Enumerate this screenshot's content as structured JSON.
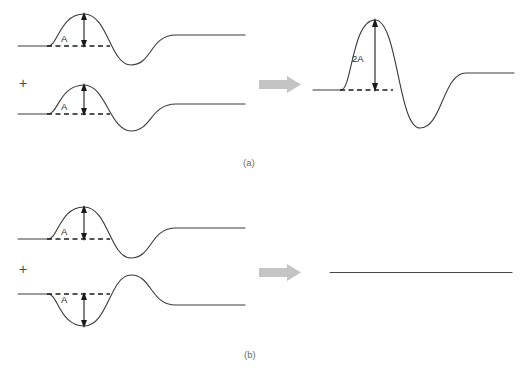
{
  "figure": {
    "background_color": "#ffffff",
    "width": 532,
    "height": 378,
    "stroke_color": "#3a3a3a",
    "dash_color": "#1a1a1a",
    "arrow_color": "#c4c4c4",
    "label_color": "#6b6b6b"
  },
  "panels": [
    {
      "id": "a",
      "label": "(a)",
      "label_pos": {
        "x": 243,
        "y": 166
      },
      "description": "Constructive interference: two identical in-phase pulses add to give a pulse of double amplitude",
      "operator": {
        "symbol": "+",
        "x": 19,
        "y": 88
      },
      "big_arrow": {
        "x": 259,
        "y": 77,
        "width": 42,
        "height": 15
      },
      "inputs": [
        {
          "name": "wave-a-top",
          "baseline_y": 46,
          "amplitude_label": "A",
          "amplitude_label_pos": {
            "x": 61,
            "y": 42
          },
          "amplitude_arrow": {
            "x": 84,
            "y_top": 15,
            "y_bottom": 46
          },
          "dash_line": {
            "x1": 47,
            "x2": 110,
            "y": 46
          },
          "peak": {
            "x": 84,
            "y": 14
          },
          "trough": {
            "x": 131,
            "y": 65
          }
        },
        {
          "name": "wave-a-bottom",
          "baseline_y": 114,
          "amplitude_label": "A",
          "amplitude_label_pos": {
            "x": 61,
            "y": 110
          },
          "amplitude_arrow": {
            "x": 84,
            "y_top": 86,
            "y_bottom": 114
          },
          "dash_line": {
            "x1": 47,
            "x2": 110,
            "y": 114
          },
          "peak": {
            "x": 84,
            "y": 85
          },
          "trough": {
            "x": 131,
            "y": 131
          }
        }
      ],
      "output": {
        "name": "wave-a-result",
        "baseline_y": 90,
        "amplitude_label": "2A",
        "amplitude_label_pos": {
          "x": 352,
          "y": 62
        },
        "amplitude_arrow": {
          "x": 375,
          "y_top": 22,
          "y_bottom": 90
        },
        "dash_line": {
          "x1": 340,
          "x2": 393,
          "y": 90
        },
        "peak": {
          "x": 375,
          "y": 20
        },
        "trough": {
          "x": 420,
          "y": 128
        }
      }
    },
    {
      "id": "b",
      "label": "(b)",
      "label_pos": {
        "x": 244,
        "y": 358
      },
      "description": "Destructive interference: a pulse and its inverted copy cancel to give a flat line",
      "operator": {
        "symbol": "+",
        "x": 19,
        "y": 274
      },
      "big_arrow": {
        "x": 259,
        "y": 265,
        "width": 42,
        "height": 15
      },
      "inputs": [
        {
          "name": "wave-b-top",
          "baseline_y": 239,
          "amplitude_label": "A",
          "amplitude_label_pos": {
            "x": 61,
            "y": 235
          },
          "amplitude_arrow": {
            "x": 84,
            "y_top": 208,
            "y_bottom": 239
          },
          "dash_line": {
            "x1": 47,
            "x2": 110,
            "y": 239
          },
          "peak": {
            "x": 84,
            "y": 207
          },
          "trough": {
            "x": 131,
            "y": 258
          }
        },
        {
          "name": "wave-b-bottom-inverted",
          "baseline_y": 294,
          "amplitude_label": "A",
          "amplitude_label_pos": {
            "x": 61,
            "y": 303
          },
          "amplitude_arrow": {
            "x": 84,
            "y_top": 294,
            "y_bottom": 325
          },
          "dash_line": {
            "x1": 47,
            "x2": 110,
            "y": 294
          },
          "trough": {
            "x": 84,
            "y": 326
          },
          "peak": {
            "x": 131,
            "y": 275
          }
        }
      ],
      "output": {
        "name": "wave-b-result-flat",
        "baseline_y": 272,
        "flat_line": {
          "x1": 330,
          "x2": 512,
          "y": 272
        }
      }
    }
  ]
}
